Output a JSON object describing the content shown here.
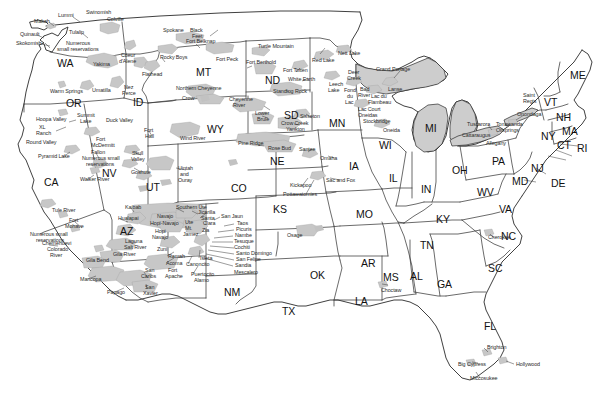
{
  "map": {
    "title": "Indian Reservations of the Contiguous United States",
    "type": "reference-map",
    "projection": "simple-outline",
    "colors": {
      "background": "#ffffff",
      "state_border": "#333333",
      "outline": "#222222",
      "reservation_fill": "#c9c9c9",
      "label_text": "#1a1a1a"
    }
  },
  "state_labels": [
    {
      "abbr": "WA",
      "x": 57,
      "y": 58
    },
    {
      "abbr": "OR",
      "x": 66,
      "y": 98
    },
    {
      "abbr": "CA",
      "x": 44,
      "y": 177
    },
    {
      "abbr": "NV",
      "x": 102,
      "y": 168
    },
    {
      "abbr": "ID",
      "x": 133,
      "y": 97
    },
    {
      "abbr": "MT",
      "x": 196,
      "y": 67
    },
    {
      "abbr": "WY",
      "x": 207,
      "y": 124
    },
    {
      "abbr": "UT",
      "x": 146,
      "y": 182
    },
    {
      "abbr": "AZ",
      "x": 120,
      "y": 226
    },
    {
      "abbr": "CO",
      "x": 231,
      "y": 183
    },
    {
      "abbr": "NM",
      "x": 224,
      "y": 287
    },
    {
      "abbr": "ND",
      "x": 265,
      "y": 75
    },
    {
      "abbr": "SD",
      "x": 284,
      "y": 110
    },
    {
      "abbr": "NE",
      "x": 270,
      "y": 156
    },
    {
      "abbr": "KS",
      "x": 273,
      "y": 204
    },
    {
      "abbr": "OK",
      "x": 310,
      "y": 270
    },
    {
      "abbr": "TX",
      "x": 282,
      "y": 306
    },
    {
      "abbr": "MN",
      "x": 329,
      "y": 118
    },
    {
      "abbr": "IA",
      "x": 349,
      "y": 161
    },
    {
      "abbr": "MO",
      "x": 356,
      "y": 209
    },
    {
      "abbr": "AR",
      "x": 361,
      "y": 258
    },
    {
      "abbr": "LA",
      "x": 355,
      "y": 296
    },
    {
      "abbr": "WI",
      "x": 379,
      "y": 140
    },
    {
      "abbr": "IL",
      "x": 389,
      "y": 173
    },
    {
      "abbr": "MS",
      "x": 383,
      "y": 272
    },
    {
      "abbr": "AL",
      "x": 410,
      "y": 271
    },
    {
      "abbr": "MI",
      "x": 425,
      "y": 123
    },
    {
      "abbr": "IN",
      "x": 421,
      "y": 184
    },
    {
      "abbr": "KY",
      "x": 436,
      "y": 214
    },
    {
      "abbr": "TN",
      "x": 420,
      "y": 240
    },
    {
      "abbr": "GA",
      "x": 437,
      "y": 279
    },
    {
      "abbr": "FL",
      "x": 484,
      "y": 321
    },
    {
      "abbr": "OH",
      "x": 452,
      "y": 165
    },
    {
      "abbr": "WV",
      "x": 477,
      "y": 187
    },
    {
      "abbr": "VA",
      "x": 499,
      "y": 204
    },
    {
      "abbr": "NC",
      "x": 501,
      "y": 231
    },
    {
      "abbr": "SC",
      "x": 488,
      "y": 263
    },
    {
      "abbr": "PA",
      "x": 492,
      "y": 156
    },
    {
      "abbr": "NY",
      "x": 541,
      "y": 131
    },
    {
      "abbr": "MD",
      "x": 512,
      "y": 176
    },
    {
      "abbr": "DE",
      "x": 551,
      "y": 178
    },
    {
      "abbr": "NJ",
      "x": 531,
      "y": 163
    },
    {
      "abbr": "CT",
      "x": 557,
      "y": 140
    },
    {
      "abbr": "RI",
      "x": 577,
      "y": 143
    },
    {
      "abbr": "MA",
      "x": 562,
      "y": 126
    },
    {
      "abbr": "NH",
      "x": 556,
      "y": 112
    },
    {
      "abbr": "VT",
      "x": 544,
      "y": 97
    },
    {
      "abbr": "ME",
      "x": 570,
      "y": 70
    }
  ],
  "reservation_labels": [
    {
      "name": "Makah",
      "x": 34,
      "y": 19
    },
    {
      "name": "Lummi",
      "x": 58,
      "y": 13
    },
    {
      "name": "Swinomish",
      "x": 86,
      "y": 10
    },
    {
      "name": "Colville",
      "x": 107,
      "y": 17
    },
    {
      "name": "Quinault",
      "x": 20,
      "y": 32
    },
    {
      "name": "Tulalip",
      "x": 69,
      "y": 30
    },
    {
      "name": "Skokomish",
      "x": 16,
      "y": 41
    },
    {
      "name": "Numerous",
      "x": 66,
      "y": 41
    },
    {
      "name": "small reservations",
      "x": 57,
      "y": 47
    },
    {
      "name": "Yakima",
      "x": 93,
      "y": 62
    },
    {
      "name": "Spokane",
      "x": 163,
      "y": 28
    },
    {
      "name": "Black",
      "x": 190,
      "y": 28
    },
    {
      "name": "Feet",
      "x": 192,
      "y": 34
    },
    {
      "name": "Fort Belknap",
      "x": 186,
      "y": 39
    },
    {
      "name": "Turtle Mountain",
      "x": 258,
      "y": 44
    },
    {
      "name": "Nett Lake",
      "x": 338,
      "y": 51
    },
    {
      "name": "Coeur",
      "x": 121,
      "y": 53
    },
    {
      "name": "d'Alene",
      "x": 119,
      "y": 59
    },
    {
      "name": "Rocky Boys",
      "x": 160,
      "y": 55
    },
    {
      "name": "Fort Peck",
      "x": 216,
      "y": 57
    },
    {
      "name": "Fort Berthold",
      "x": 246,
      "y": 60
    },
    {
      "name": "Red Lake",
      "x": 312,
      "y": 58
    },
    {
      "name": "Grand Portage",
      "x": 376,
      "y": 67
    },
    {
      "name": "Flathead",
      "x": 142,
      "y": 72
    },
    {
      "name": "Fort Totten",
      "x": 283,
      "y": 68
    },
    {
      "name": "White Earth",
      "x": 288,
      "y": 77
    },
    {
      "name": "Deer",
      "x": 348,
      "y": 70
    },
    {
      "name": "Creek",
      "x": 347,
      "y": 76
    },
    {
      "name": "Saint",
      "x": 523,
      "y": 93
    },
    {
      "name": "Regis",
      "x": 523,
      "y": 99
    },
    {
      "name": "Northern Cheyenne",
      "x": 176,
      "y": 86
    },
    {
      "name": "Crow",
      "x": 182,
      "y": 96
    },
    {
      "name": "Standing Rock",
      "x": 273,
      "y": 89
    },
    {
      "name": "Leech",
      "x": 329,
      "y": 82
    },
    {
      "name": "Lake",
      "x": 328,
      "y": 88
    },
    {
      "name": "Fond",
      "x": 344,
      "y": 88
    },
    {
      "name": "du",
      "x": 347,
      "y": 94
    },
    {
      "name": "Lac",
      "x": 345,
      "y": 100
    },
    {
      "name": "Bad",
      "x": 360,
      "y": 87
    },
    {
      "name": "River",
      "x": 358,
      "y": 93
    },
    {
      "name": "Lanse",
      "x": 388,
      "y": 87
    },
    {
      "name": "Lac du",
      "x": 371,
      "y": 94
    },
    {
      "name": "Flambeau",
      "x": 368,
      "y": 100
    },
    {
      "name": "Cheyenne",
      "x": 229,
      "y": 97
    },
    {
      "name": "River",
      "x": 233,
      "y": 103
    },
    {
      "name": "Lower",
      "x": 255,
      "y": 111
    },
    {
      "name": "Brule",
      "x": 257,
      "y": 117
    },
    {
      "name": "Lac Court",
      "x": 358,
      "y": 107
    },
    {
      "name": "Oneidas",
      "x": 358,
      "y": 113
    },
    {
      "name": "Stockbridge",
      "x": 363,
      "y": 119
    },
    {
      "name": "Oneida",
      "x": 383,
      "y": 128
    },
    {
      "name": "Tuscarora",
      "x": 467,
      "y": 122
    },
    {
      "name": "Cattaraugus",
      "x": 462,
      "y": 133
    },
    {
      "name": "Tonawanda",
      "x": 496,
      "y": 122
    },
    {
      "name": "Oilsprings",
      "x": 496,
      "y": 128
    },
    {
      "name": "Onondaga",
      "x": 517,
      "y": 112
    },
    {
      "name": "Allegany",
      "x": 486,
      "y": 141
    },
    {
      "name": "Umatilla",
      "x": 92,
      "y": 88
    },
    {
      "name": "Nez",
      "x": 124,
      "y": 85
    },
    {
      "name": "Perce",
      "x": 122,
      "y": 91
    },
    {
      "name": "Warm Springs",
      "x": 50,
      "y": 89
    },
    {
      "name": "Hoopa Valley",
      "x": 36,
      "y": 117
    },
    {
      "name": "Summit",
      "x": 77,
      "y": 113
    },
    {
      "name": "Lake",
      "x": 80,
      "y": 119
    },
    {
      "name": "Duck Valley",
      "x": 106,
      "y": 118
    },
    {
      "name": "Fort",
      "x": 144,
      "y": 128
    },
    {
      "name": "Hall",
      "x": 145,
      "y": 134
    },
    {
      "name": "Wind River",
      "x": 180,
      "y": 136
    },
    {
      "name": "XL",
      "x": 39,
      "y": 125
    },
    {
      "name": "Ranch",
      "x": 36,
      "y": 131
    },
    {
      "name": "Round Valley",
      "x": 26,
      "y": 140
    },
    {
      "name": "Fort",
      "x": 96,
      "y": 137
    },
    {
      "name": "McDermitt",
      "x": 91,
      "y": 143
    },
    {
      "name": "Crow Creek",
      "x": 281,
      "y": 121
    },
    {
      "name": "Yankton",
      "x": 286,
      "y": 127
    },
    {
      "name": "Sisseton",
      "x": 300,
      "y": 114
    },
    {
      "name": "Pine Ridge",
      "x": 238,
      "y": 141
    },
    {
      "name": "Rose Bud",
      "x": 268,
      "y": 146
    },
    {
      "name": "Santee",
      "x": 299,
      "y": 147
    },
    {
      "name": "Pyramid Lake",
      "x": 38,
      "y": 154
    },
    {
      "name": "Fallon",
      "x": 91,
      "y": 150
    },
    {
      "name": "Numerous small",
      "x": 82,
      "y": 156
    },
    {
      "name": "reservations",
      "x": 86,
      "y": 162
    },
    {
      "name": "Skull",
      "x": 132,
      "y": 151
    },
    {
      "name": "Valley",
      "x": 131,
      "y": 157
    },
    {
      "name": "Goshute",
      "x": 131,
      "y": 170
    },
    {
      "name": "Uintah",
      "x": 178,
      "y": 166
    },
    {
      "name": "and",
      "x": 180,
      "y": 172
    },
    {
      "name": "Ouray",
      "x": 178,
      "y": 178
    },
    {
      "name": "Walker River",
      "x": 80,
      "y": 177
    },
    {
      "name": "Omaha",
      "x": 320,
      "y": 156
    },
    {
      "name": "Sac and Fox",
      "x": 326,
      "y": 178
    },
    {
      "name": "Kickapoo",
      "x": 290,
      "y": 183
    },
    {
      "name": "Pottawatomies",
      "x": 283,
      "y": 192
    },
    {
      "name": "Tule River",
      "x": 52,
      "y": 208
    },
    {
      "name": "Kaibab",
      "x": 125,
      "y": 205
    },
    {
      "name": "Hualapai",
      "x": 118,
      "y": 216
    },
    {
      "name": "Navajo",
      "x": 157,
      "y": 214
    },
    {
      "name": "Hopi-Navajo",
      "x": 150,
      "y": 221
    },
    {
      "name": "Southern Ute",
      "x": 176,
      "y": 205
    },
    {
      "name": "Jicarilla",
      "x": 198,
      "y": 210
    },
    {
      "name": "Santa",
      "x": 201,
      "y": 216
    },
    {
      "name": "Clara",
      "x": 203,
      "y": 221
    },
    {
      "name": "San Jaun",
      "x": 221,
      "y": 214
    },
    {
      "name": "Taos",
      "x": 237,
      "y": 221
    },
    {
      "name": "Ute",
      "x": 185,
      "y": 220
    },
    {
      "name": "Mt.",
      "x": 185,
      "y": 226
    },
    {
      "name": "Jamez",
      "x": 183,
      "y": 232
    },
    {
      "name": "Zia",
      "x": 202,
      "y": 228
    },
    {
      "name": "Hopi",
      "x": 155,
      "y": 229
    },
    {
      "name": "Navajo",
      "x": 152,
      "y": 235
    },
    {
      "name": "Picuris",
      "x": 236,
      "y": 227
    },
    {
      "name": "Nambe",
      "x": 235,
      "y": 233
    },
    {
      "name": "Tesuque",
      "x": 234,
      "y": 239
    },
    {
      "name": "Cochiti",
      "x": 234,
      "y": 245
    },
    {
      "name": "Santo Domingo",
      "x": 236,
      "y": 251
    },
    {
      "name": "San Felipe",
      "x": 236,
      "y": 257
    },
    {
      "name": "Sandia",
      "x": 235,
      "y": 263
    },
    {
      "name": "Mescalero",
      "x": 234,
      "y": 270
    },
    {
      "name": "Fort",
      "x": 69,
      "y": 218
    },
    {
      "name": "Mohave",
      "x": 65,
      "y": 224
    },
    {
      "name": "Laguna",
      "x": 125,
      "y": 239
    },
    {
      "name": "Salt River",
      "x": 124,
      "y": 245
    },
    {
      "name": "Numerous small",
      "x": 30,
      "y": 232
    },
    {
      "name": "reservations",
      "x": 36,
      "y": 238
    },
    {
      "name": "Chemehuevi",
      "x": 42,
      "y": 241
    },
    {
      "name": "Colorado",
      "x": 47,
      "y": 247
    },
    {
      "name": "River",
      "x": 50,
      "y": 253
    },
    {
      "name": "Zuni",
      "x": 157,
      "y": 247
    },
    {
      "name": "Ramah",
      "x": 168,
      "y": 254
    },
    {
      "name": "Gila River",
      "x": 113,
      "y": 252
    },
    {
      "name": "Gila Bend",
      "x": 86,
      "y": 258
    },
    {
      "name": "Acoma",
      "x": 166,
      "y": 261
    },
    {
      "name": "Isleta",
      "x": 200,
      "y": 256
    },
    {
      "name": "Canoncito",
      "x": 186,
      "y": 262
    },
    {
      "name": "San",
      "x": 145,
      "y": 268
    },
    {
      "name": "Carlos",
      "x": 141,
      "y": 274
    },
    {
      "name": "Fort",
      "x": 168,
      "y": 268
    },
    {
      "name": "Apache",
      "x": 165,
      "y": 274
    },
    {
      "name": "Puertocito",
      "x": 191,
      "y": 272
    },
    {
      "name": "Alamo",
      "x": 194,
      "y": 278
    },
    {
      "name": "Maricopa",
      "x": 80,
      "y": 277
    },
    {
      "name": "San",
      "x": 145,
      "y": 285
    },
    {
      "name": "Xavier",
      "x": 143,
      "y": 291
    },
    {
      "name": "Papago",
      "x": 107,
      "y": 290
    },
    {
      "name": "Osage",
      "x": 287,
      "y": 233
    },
    {
      "name": "Cherokee",
      "x": 488,
      "y": 235
    },
    {
      "name": "Choctaw",
      "x": 381,
      "y": 288
    },
    {
      "name": "Brighton",
      "x": 487,
      "y": 345
    },
    {
      "name": "Big Cypress",
      "x": 458,
      "y": 362
    },
    {
      "name": "Hollywood",
      "x": 516,
      "y": 362
    },
    {
      "name": "Miccosukee",
      "x": 470,
      "y": 376
    }
  ]
}
